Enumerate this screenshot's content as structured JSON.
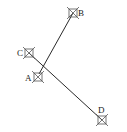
{
  "diagram": {
    "stroke_color": "#2a2a2a",
    "marker_color": "#555555",
    "points": [
      {
        "id": "A",
        "label": "A",
        "x": 38,
        "y": 77,
        "lx": 25,
        "ly": 81
      },
      {
        "id": "B",
        "label": "B",
        "x": 73,
        "y": 13,
        "lx": 78,
        "ly": 16
      },
      {
        "id": "C",
        "label": "C",
        "x": 29,
        "y": 53,
        "lx": 17,
        "ly": 56
      },
      {
        "id": "D",
        "label": "D",
        "x": 102,
        "y": 120,
        "lx": 98,
        "ly": 113
      }
    ],
    "segments": [
      {
        "from": "B",
        "to": "A"
      },
      {
        "from": "C",
        "to": "D"
      }
    ]
  }
}
